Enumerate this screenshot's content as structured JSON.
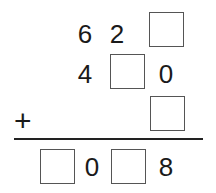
{
  "puzzle": {
    "type": "column-addition",
    "operator": "+",
    "rows": [
      [
        "6",
        "2",
        ""
      ],
      [
        "",
        "4",
        "",
        "0"
      ],
      [
        ""
      ]
    ],
    "addend1": {
      "hundreds": "6",
      "tens": "2",
      "ones": ""
    },
    "addend2": {
      "hundreds": "4",
      "tens": "",
      "ones": "0"
    },
    "addend3": {
      "ones": ""
    },
    "result": {
      "thousands": "",
      "hundreds": "0",
      "tens": "",
      "ones": "8"
    }
  }
}
